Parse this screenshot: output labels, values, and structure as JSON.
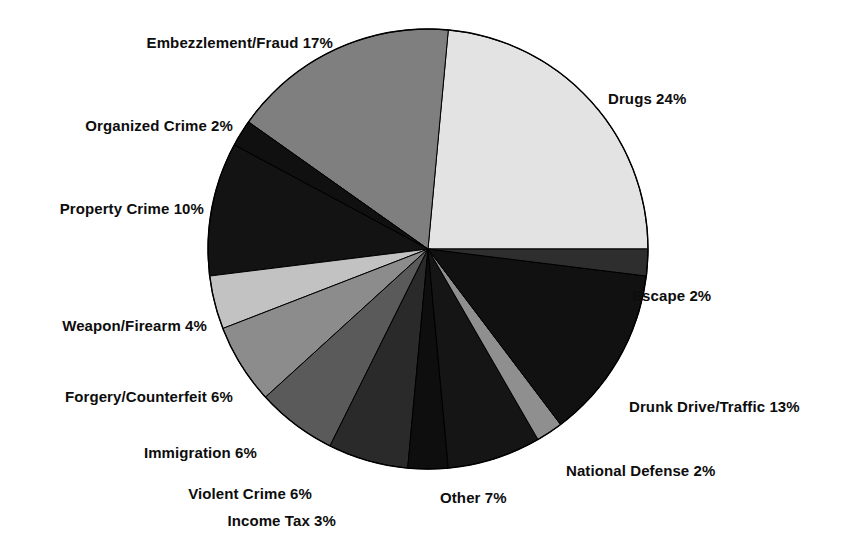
{
  "chart_data": {
    "type": "pie",
    "title": "",
    "subtitle": "",
    "xlabel": "",
    "ylabel": "",
    "legend_position": "labels-around-pie",
    "grid": false,
    "units": "percent",
    "total": 102,
    "categories": [
      "Drugs",
      "Embezzlement/Fraud",
      "Organized Crime",
      "Property Crime",
      "Weapon/Firearm",
      "Forgery/Counterfeit",
      "Immigration",
      "Violent Crime",
      "Income Tax",
      "Other",
      "National Defense",
      "Drunk Drive/Traffic",
      "Escape"
    ],
    "values": [
      24,
      17,
      2,
      10,
      4,
      6,
      6,
      6,
      3,
      7,
      2,
      13,
      2
    ],
    "labels": [
      "Drugs 24%",
      "Embezzlement/Fraud 17%",
      "Organized Crime 2%",
      "Property Crime 10%",
      "Weapon/Firearm 4%",
      "Forgery/Counterfeit 6%",
      "Immigration 6%",
      "Violent Crime 6%",
      "Income Tax 3%",
      "Other 7%",
      "National Defense 2%",
      "Drunk Drive/Traffic 13%",
      "Escape 2%"
    ],
    "slice_colors": [
      "#e3e3e3",
      "#7f7f7f",
      "#101010",
      "#131313",
      "#c2c2c2",
      "#8c8c8c",
      "#5a5a5a",
      "#2a2a2a",
      "#0e0e0e",
      "#151515",
      "#8f8f8f",
      "#111111",
      "#2e2e2e"
    ],
    "slice_geometry": {
      "center_x": 428,
      "center_y": 249,
      "radius": 220,
      "start_angle_deg": 0,
      "direction": "counterclockwise",
      "outline_color": "#000000"
    },
    "label_positions": [
      {
        "label": "Drugs 24%",
        "x": 608,
        "y": 98,
        "align": "r"
      },
      {
        "label": "Embezzlement/Fraud 17%",
        "x": 333,
        "y": 42,
        "align": "l"
      },
      {
        "label": "Organized Crime 2%",
        "x": 233,
        "y": 125,
        "align": "l"
      },
      {
        "label": "Property Crime 10%",
        "x": 204,
        "y": 208,
        "align": "l"
      },
      {
        "label": "Weapon/Firearm 4%",
        "x": 207,
        "y": 325,
        "align": "l"
      },
      {
        "label": "Forgery/Counterfeit 6%",
        "x": 233,
        "y": 396,
        "align": "l"
      },
      {
        "label": "Immigration 6%",
        "x": 257,
        "y": 452,
        "align": "l"
      },
      {
        "label": "Violent Crime 6%",
        "x": 312,
        "y": 493,
        "align": "l"
      },
      {
        "label": "Income Tax 3%",
        "x": 336,
        "y": 520,
        "align": "l"
      },
      {
        "label": "Other 7%",
        "x": 440,
        "y": 497,
        "align": "r"
      },
      {
        "label": "National Defense 2%",
        "x": 566,
        "y": 470,
        "align": "r"
      },
      {
        "label": "Drunk Drive/Traffic 13%",
        "x": 629,
        "y": 406,
        "align": "r"
      },
      {
        "label": "Escape 2%",
        "x": 632,
        "y": 295,
        "align": "r"
      }
    ]
  }
}
